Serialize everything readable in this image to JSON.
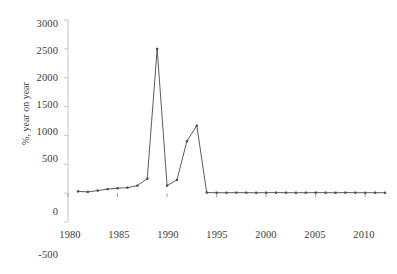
{
  "chart_data": {
    "type": "line",
    "title": "",
    "xlabel": "",
    "ylabel": "%, year on year",
    "xlim": [
      1980,
      2012.5
    ],
    "ylim": [
      -500,
      3000
    ],
    "ytick_values": [
      3000,
      2500,
      2000,
      1500,
      1000,
      500,
      0,
      -500
    ],
    "ytick_labels": [
      "3000",
      "2500",
      "2000",
      "1500",
      "1000",
      "500",
      "0",
      "-500"
    ],
    "xtick_values": [
      1980,
      1985,
      1990,
      1995,
      2000,
      2005,
      2010
    ],
    "xtick_labels": [
      "1980",
      "1985",
      "1990",
      "1995",
      "2000",
      "2005",
      "2010"
    ],
    "grid": false,
    "legend": null,
    "series": [
      {
        "name": "inflation",
        "color": "#4a4a4a",
        "marker": "square",
        "x": [
          1981,
          1982,
          1983,
          1984,
          1985,
          1986,
          1987,
          1988,
          1989,
          1990,
          1991,
          1992,
          1993,
          1994,
          1995,
          1996,
          1997,
          1998,
          1999,
          2000,
          2001,
          2002,
          2003,
          2004,
          2005,
          2006,
          2007,
          2008,
          2009,
          2010,
          2011,
          2012
        ],
        "values": [
          30,
          22,
          45,
          70,
          85,
          95,
          130,
          250,
          2500,
          130,
          230,
          900,
          1170,
          10,
          8,
          7,
          9,
          8,
          7,
          8,
          9,
          8,
          7,
          8,
          9,
          8,
          7,
          9,
          8,
          7,
          8,
          7
        ]
      }
    ]
  },
  "axis": {
    "y_axis_label": "%, year on year",
    "zero_line_value": "0"
  }
}
